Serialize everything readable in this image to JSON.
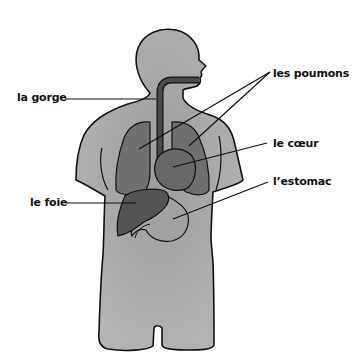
{
  "diagram": {
    "type": "anatomical-diagram",
    "language": "fr",
    "colors": {
      "body": "#a9a9a9",
      "body_outline": "#111111",
      "lungs": "#707070",
      "heart": "#676767",
      "liver": "#545454",
      "stomach": "#a0a0a0",
      "trachea": "#4a4a4a",
      "leader_line": "#111111"
    },
    "labels": [
      {
        "id": "gorge",
        "text": "la gorge",
        "side": "left"
      },
      {
        "id": "poumons",
        "text": "les poumons",
        "side": "right"
      },
      {
        "id": "coeur",
        "text": "le cœur",
        "side": "right"
      },
      {
        "id": "estomac",
        "text": "l’estomac",
        "side": "right"
      },
      {
        "id": "foie",
        "text": "le foie",
        "side": "left"
      }
    ]
  }
}
